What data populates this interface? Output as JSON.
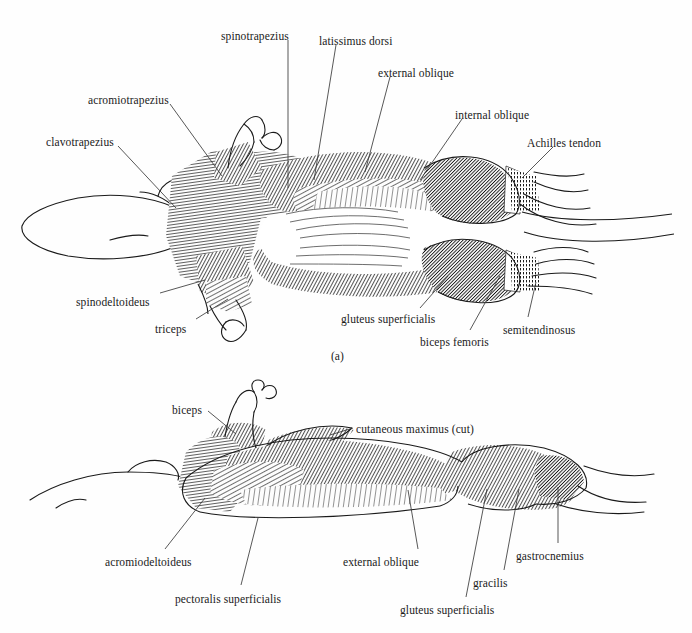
{
  "figure": {
    "caption_a": "(a)",
    "panels": [
      {
        "id": "a",
        "tag": "(a)",
        "view": "dorsal view of superficial muscles",
        "labels": [
          {
            "name": "spinotrapezius",
            "text": "spinotrapezius",
            "x": 221,
            "y": 31,
            "anchor": "start",
            "leader": [
              [
                288,
                40
              ],
              [
                288,
                188
              ]
            ]
          },
          {
            "name": "latissimus-dorsi",
            "text": "latissimus dorsi",
            "x": 319,
            "y": 36,
            "anchor": "start",
            "leader": [
              [
                336,
                45
              ],
              [
                314,
                180
              ]
            ]
          },
          {
            "name": "external-oblique",
            "text": "external oblique",
            "x": 378,
            "y": 68,
            "anchor": "start",
            "leader": [
              [
                390,
                77
              ],
              [
                365,
                172
              ]
            ]
          },
          {
            "name": "internal-oblique",
            "text": "internal oblique",
            "x": 455,
            "y": 110,
            "anchor": "start",
            "leader": [
              [
                462,
                119
              ],
              [
                420,
                180
              ]
            ]
          },
          {
            "name": "achilles-tendon",
            "text": "Achilles tendon",
            "x": 527,
            "y": 138,
            "anchor": "start",
            "leader": [
              [
                553,
                147
              ],
              [
                522,
                178
              ]
            ]
          },
          {
            "name": "acromiotrapezius",
            "text": "acromiotrapezius",
            "x": 88,
            "y": 95,
            "anchor": "start",
            "leader": [
              [
                170,
                104
              ],
              [
                222,
                176
              ]
            ]
          },
          {
            "name": "clavotrapezius",
            "text": "clavotrapezius",
            "x": 46,
            "y": 137,
            "anchor": "start",
            "leader": [
              [
                118,
                146
              ],
              [
                176,
                208
              ]
            ]
          },
          {
            "name": "spinodeltoideus",
            "text": "spinodeltoideus",
            "x": 76,
            "y": 297,
            "anchor": "start",
            "leader": [
              [
                160,
                293
              ],
              [
                205,
                280
              ]
            ]
          },
          {
            "name": "triceps",
            "text": "triceps",
            "x": 155,
            "y": 324,
            "anchor": "start",
            "leader": [
              [
                196,
                319
              ],
              [
                228,
                299
              ]
            ]
          },
          {
            "name": "gluteus-superficialis",
            "text": "gluteus superficialis",
            "x": 341,
            "y": 314,
            "anchor": "start",
            "leader": [
              [
                420,
                308
              ],
              [
                448,
                276
              ]
            ]
          },
          {
            "name": "biceps-femoris",
            "text": "biceps femoris",
            "x": 420,
            "y": 337,
            "anchor": "start",
            "leader": [
              [
                470,
                330
              ],
              [
                500,
                276
              ]
            ]
          },
          {
            "name": "semitendinosus",
            "text": "semitendinosus",
            "x": 503,
            "y": 325,
            "anchor": "start",
            "leader": [
              [
                528,
                317
              ],
              [
                536,
                282
              ]
            ]
          }
        ]
      },
      {
        "id": "b",
        "view": "lateral view of superficial muscles",
        "labels": [
          {
            "name": "biceps",
            "text": "biceps",
            "x": 172,
            "y": 405,
            "anchor": "start",
            "leader": [
              [
                208,
                411
              ],
              [
                236,
                434
              ]
            ]
          },
          {
            "name": "cutaneous-maximus-cut",
            "text": "cutaneous maximus (cut)",
            "x": 356,
            "y": 424,
            "anchor": "start",
            "leader": [
              [
                353,
                428
              ],
              [
                330,
                435
              ]
            ]
          },
          {
            "name": "acromiodeltoideus",
            "text": "acromiodeltoideus",
            "x": 105,
            "y": 557,
            "anchor": "start",
            "leader": [
              [
                165,
                549
              ],
              [
                205,
                498
              ]
            ]
          },
          {
            "name": "pectoralis-superficialis",
            "text": "pectoralis superficialis",
            "x": 175,
            "y": 594,
            "anchor": "start",
            "leader": [
              [
                241,
                585
              ],
              [
                258,
                518
              ]
            ]
          },
          {
            "name": "external-oblique-b",
            "text": "external oblique",
            "x": 343,
            "y": 557,
            "anchor": "start",
            "leader": [
              [
                418,
                549
              ],
              [
                408,
                490
              ]
            ]
          },
          {
            "name": "gluteus-superficialis-b",
            "text": "gluteus superficialis",
            "x": 400,
            "y": 605,
            "anchor": "start",
            "leader": [
              [
                466,
                597
              ],
              [
                487,
                489
              ]
            ]
          },
          {
            "name": "gracilis",
            "text": "gracilis",
            "x": 473,
            "y": 578,
            "anchor": "start",
            "leader": [
              [
                504,
                570
              ],
              [
                519,
                489
              ]
            ]
          },
          {
            "name": "gastrocnemius",
            "text": "gastrocnemius",
            "x": 516,
            "y": 551,
            "anchor": "start",
            "leader": [
              [
                558,
                543
              ],
              [
                558,
                487
              ]
            ]
          }
        ]
      }
    ]
  },
  "style": {
    "ink": "#1a1a1a",
    "leader": "#3a3a3a",
    "background": "#fefefe",
    "muscle_fill": "#f4f4f4"
  }
}
